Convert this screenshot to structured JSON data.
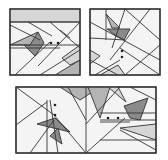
{
  "colors": {
    "background": "#ffffff",
    "panel": "#f4f4f4",
    "line": "#333333",
    "dark": "#8a8a8a",
    "mid": "#b4b4b4",
    "light": "#d6d6d6"
  },
  "panels": [
    {
      "name": "panel-top-left",
      "rect": [
        10,
        9,
        70,
        66
      ],
      "polygons": [
        {
          "pts": "10,22 80,22 80,9 10,9",
          "fill": "light"
        },
        {
          "pts": "24,45 38,32 44,43 35,56",
          "fill": "dark"
        },
        {
          "pts": "10,45 30,45 38,32",
          "fill": "mid"
        },
        {
          "pts": "55,75 80,60 80,75",
          "fill": "mid"
        },
        {
          "pts": "62,58 80,45 80,60 70,65",
          "fill": "light"
        }
      ],
      "lines": [
        "10,22 80,22",
        "10,25 40,40",
        "28,22 52,36",
        "80,22 38,66",
        "50,22 80,48",
        "10,45 80,45",
        "10,48 60,48",
        "15,75 50,42",
        "40,75 80,50",
        "60,30 70,38"
      ],
      "dots": [
        [
          51,
          43
        ],
        [
          58,
          43
        ]
      ]
    },
    {
      "name": "panel-top-right",
      "rect": [
        90,
        9,
        70,
        66
      ],
      "polygons": [
        {
          "pts": "106,14 112,28 120,28",
          "fill": "mid"
        },
        {
          "pts": "107,29 130,29 124,40 115,35",
          "fill": "dark"
        },
        {
          "pts": "90,50 100,56 90,64",
          "fill": "light"
        },
        {
          "pts": "100,75 118,65 125,75",
          "fill": "light"
        }
      ],
      "lines": [
        "90,22 160,60",
        "106,9 106,40",
        "125,9 112,48",
        "150,9 110,60",
        "90,38 125,40",
        "120,48 160,75",
        "90,60 118,75",
        "95,75 120,60",
        "125,9 160,40",
        "125,75 160,45"
      ],
      "dots": [
        [
          122,
          51
        ],
        [
          122,
          57
        ]
      ]
    },
    {
      "name": "panel-bottom",
      "rect": [
        16,
        87,
        140,
        66
      ],
      "polygons": [
        {
          "pts": "60,87 80,100 100,87",
          "fill": "mid"
        },
        {
          "pts": "88,87 100,118 110,87",
          "fill": "mid"
        },
        {
          "pts": "37,124 55,118 70,132",
          "fill": "dark"
        },
        {
          "pts": "50,136 58,128 62,144",
          "fill": "dark"
        },
        {
          "pts": "124,106 148,98 140,120 130,118",
          "fill": "dark"
        },
        {
          "pts": "108,87 118,87 126,102",
          "fill": "light"
        },
        {
          "pts": "120,128 156,124 156,140",
          "fill": "light"
        }
      ],
      "lines": [
        "16,87 54,115",
        "47,100 47,153",
        "50,100 58,153",
        "86,87 86,153",
        "54,115 86,153",
        "86,153 125,118",
        "86,124 120,87",
        "16,125 47,102",
        "100,120 156,120",
        "100,122 130,122",
        "100,113 156,113",
        "120,130 156,150",
        "100,140 156,140",
        "30,153 54,120",
        "130,87 156,100",
        "68,87 86,120"
      ],
      "dots": [
        [
          55,
          105
        ],
        [
          55,
          115
        ],
        [
          108,
          118
        ],
        [
          118,
          118
        ]
      ]
    }
  ]
}
